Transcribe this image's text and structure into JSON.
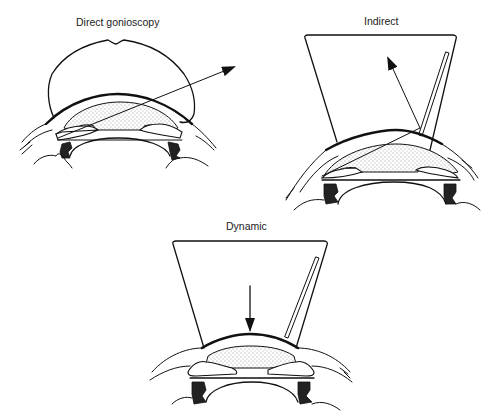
{
  "figure": {
    "panels": [
      {
        "id": "direct",
        "title": "Direct gonioscopy",
        "lens_shape": "dome-lens",
        "light_path": "ray exits lens outward to upper right (direct view)"
      },
      {
        "id": "indirect",
        "title": "Indirect",
        "lens_shape": "truncated-cone-lens-with-mirror",
        "light_path": "ray reflects off mirror toward upper left (indirect view)"
      },
      {
        "id": "dynamic",
        "title": "Dynamic",
        "lens_shape": "truncated-cone-lens-with-mirror",
        "light_path": "downward arrow indicating pressure on cornea"
      }
    ],
    "colors": {
      "line": "#111111",
      "background": "#ffffff",
      "stipple": "#333333"
    }
  }
}
